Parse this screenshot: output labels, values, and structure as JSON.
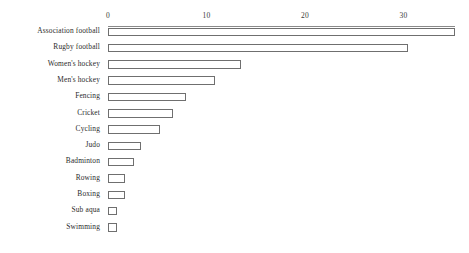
{
  "chart_data": {
    "type": "bar",
    "orientation": "horizontal",
    "title": "",
    "subtitle": "",
    "xlabel": "",
    "ylabel": "",
    "xlim": [
      0,
      36.6
    ],
    "xticks": [
      0,
      10,
      20,
      30
    ],
    "xtick_labels": [
      "0",
      "10",
      "20",
      "30"
    ],
    "grid": false,
    "legend": null,
    "legend_position": "none",
    "axis_position": "top",
    "bar_style": {
      "fill": "#ffffff",
      "edge": "#6f6f6f",
      "edge_width": 1
    },
    "categories": [
      "Association football",
      "Rugby football",
      "Women's hockey",
      "Men's hockey",
      "Fencing",
      "Cricket",
      "Cycling",
      "Judo",
      "Badminton",
      "Rowing",
      "Boxing",
      "Sub aqua",
      "Swimming"
    ],
    "values": [
      35.2,
      30.5,
      13.5,
      10.9,
      7.9,
      6.6,
      5.3,
      3.3,
      2.6,
      1.7,
      1.7,
      0.9,
      0.9
    ],
    "annotations": []
  }
}
